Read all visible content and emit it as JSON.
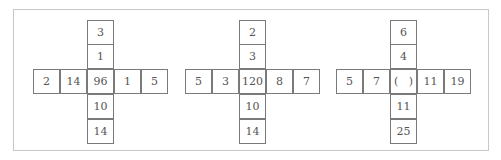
{
  "puzzles": [
    {
      "center": "96",
      "top": [
        "3",
        "1"
      ],
      "bottom": [
        "10",
        "14"
      ],
      "left": [
        "2",
        "14"
      ],
      "right": [
        "1",
        "5"
      ]
    },
    {
      "center": "120",
      "top": [
        "2",
        "3"
      ],
      "bottom": [
        "10",
        "14"
      ],
      "left": [
        "5",
        "3"
      ],
      "right": [
        "8",
        "7"
      ]
    },
    {
      "center": "(   )",
      "top": [
        "6",
        "4"
      ],
      "bottom": [
        "11",
        "25"
      ],
      "left": [
        "5",
        "7"
      ],
      "right": [
        "11",
        "19"
      ]
    }
  ]
}
